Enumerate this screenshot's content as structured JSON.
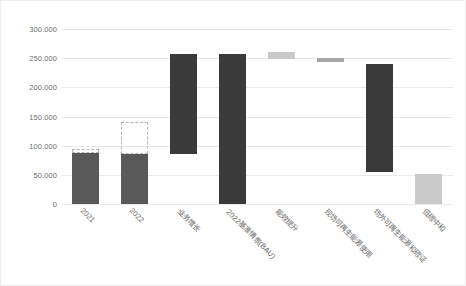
{
  "chart_data": {
    "type": "bar",
    "title": "",
    "subtitle": "",
    "xlabel": "",
    "ylabel": "",
    "ylim": [
      0,
      300000
    ],
    "grid": true,
    "legend": "none",
    "yticks": [
      "300.000",
      "250.000",
      "200.000",
      "150.000",
      "100.000",
      "50.000",
      "0"
    ],
    "ytick_values": [
      300000,
      250000,
      200000,
      150000,
      100000,
      50000,
      0
    ],
    "categories": [
      "2021",
      "2022",
      "业务增长",
      "2022基准情景(BAU)",
      "能效提升",
      "现场可再生能源使用",
      "场外可再生能源和碳证",
      "低碳中和"
    ],
    "bars": [
      {
        "label": "2021",
        "base": 0,
        "top": 88000,
        "style": "dark",
        "ghost_top": 95000
      },
      {
        "label": "2022",
        "base": 0,
        "top": 85000,
        "style": "dark",
        "ghost_top": 140000
      },
      {
        "label": "业务增长",
        "base": 85000,
        "top": 258000,
        "style": "darker",
        "ghost_top": null
      },
      {
        "label": "2022基准情景(BAU)",
        "base": 0,
        "top": 258000,
        "style": "darker",
        "ghost_top": null
      },
      {
        "label": "能效提升",
        "base": 248000,
        "top": 260000,
        "style": "light",
        "ghost_top": null
      },
      {
        "label": "现场可再生能源使用",
        "base": 244000,
        "top": 250000,
        "style": "mid",
        "ghost_top": null
      },
      {
        "label": "场外可再生能源和碳证",
        "base": 55000,
        "top": 240000,
        "style": "darker",
        "ghost_top": null
      },
      {
        "label": "低碳中和",
        "base": 0,
        "top": 52000,
        "style": "light",
        "ghost_top": null
      }
    ]
  }
}
